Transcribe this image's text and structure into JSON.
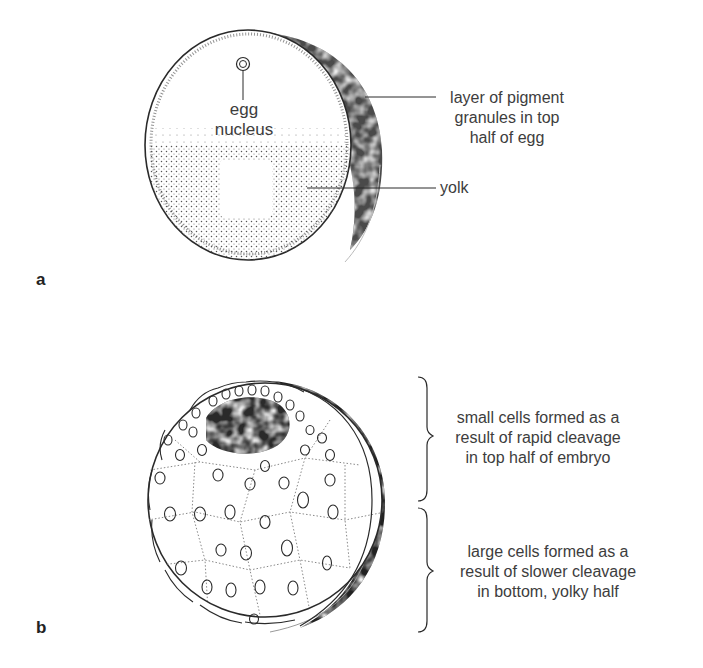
{
  "figure": {
    "panel_a": {
      "label": "a",
      "title": "Unfertilized / fertilized frog egg",
      "labels": {
        "nucleus_line1": "egg",
        "nucleus_line2": "nucleus",
        "pigment_line1": "layer of pigment",
        "pigment_line2": "granules in top",
        "pigment_line3": "half of egg",
        "yolk": "yolk"
      }
    },
    "panel_b": {
      "label": "b",
      "title": "Cleaving frog embryo",
      "labels": {
        "top_line1": "small cells formed as a",
        "top_line2": "result of rapid cleavage",
        "top_line3": "in top half of embryo",
        "bottom_line1": "large cells formed as a",
        "bottom_line2": "result of slower cleavage",
        "bottom_line3": "in bottom, yolky half"
      }
    },
    "colors": {
      "ink": "#2a2a2a",
      "text": "#3d3d3d",
      "pigment": "#1e1e1e",
      "background": "#ffffff"
    }
  }
}
